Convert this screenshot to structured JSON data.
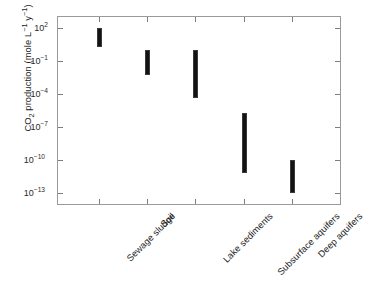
{
  "chart_data": {
    "type": "bar",
    "subtype": "range-bar",
    "title": "",
    "xlabel": "",
    "ylabel": "CO2 production (mole L^-1 y^-1)",
    "ylabel_parts": {
      "prefix": "CO",
      "sub": "2",
      "mid": " production (mole L",
      "sup1": "−1",
      "mid2": " y",
      "sup2": "−1",
      "suffix": ")"
    },
    "yscale": "log",
    "ylim": [
      1e-14,
      1000
    ],
    "ytick_values": [
      100,
      0.1,
      0.0001,
      1e-07,
      1e-10,
      1e-13
    ],
    "ytick_labels": [
      "10²",
      "10⁻¹",
      "10⁻⁴",
      "10⁻⁷",
      "10⁻¹⁰",
      "10⁻¹³"
    ],
    "ytick_exponents": [
      "2",
      "−1",
      "−4",
      "−7",
      "−10",
      "−13"
    ],
    "grid": false,
    "legend": false,
    "categories": [
      "Sewage sludge",
      "Soil",
      "Lake sediments",
      "Subsurface aquifers",
      "Deep aquifers"
    ],
    "ranges": [
      {
        "category": "Sewage sludge",
        "low": 2.0,
        "high": 100.0,
        "low_exp": 0.3,
        "high_exp": 2.0
      },
      {
        "category": "Soil",
        "low": 0.005,
        "high": 1.0,
        "low_exp": -2.3,
        "high_exp": 0.0
      },
      {
        "category": "Lake sediments",
        "low": 4e-05,
        "high": 1.0,
        "low_exp": -4.4,
        "high_exp": 0.0
      },
      {
        "category": "Subsurface aquifers",
        "low": 6e-12,
        "high": 2e-06,
        "low_exp": -11.2,
        "high_exp": -5.7
      },
      {
        "category": "Deep aquifers",
        "low": 1e-13,
        "high": 1e-10,
        "low_exp": -13.0,
        "high_exp": -10.0
      }
    ],
    "colors": {
      "bar": "#131313",
      "axis": "#9a9a9a",
      "tick": "#7d7d7d",
      "text": "#1a1a1a",
      "background": "#ffffff"
    }
  }
}
